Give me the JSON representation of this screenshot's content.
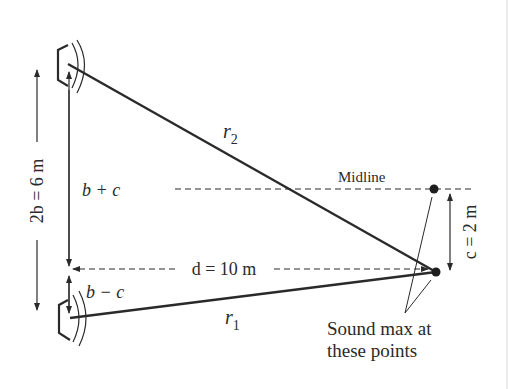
{
  "diagram": {
    "type": "two-source sound interference geometry",
    "labels": {
      "two_b": "2b = 6 m",
      "b_plus_c": "b + c",
      "b_minus_c": "b − c",
      "d": "d = 10 m",
      "c": "c = 2 m",
      "r1": "r",
      "r1_sub": "1",
      "r2": "r",
      "r2_sub": "2",
      "midline": "Midline",
      "note_line1": "Sound max at",
      "note_line2": "these points"
    },
    "colors": {
      "ink": "#2a2a2a",
      "background": "#ffffff"
    },
    "nodes": [
      {
        "id": "speaker-top",
        "x": 68,
        "y": 62
      },
      {
        "id": "speaker-bottom",
        "x": 70,
        "y": 315
      },
      {
        "id": "midline-point",
        "x": 434,
        "y": 189
      },
      {
        "id": "listener-point",
        "x": 436,
        "y": 272
      }
    ]
  }
}
